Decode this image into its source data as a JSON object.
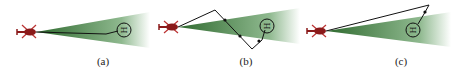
{
  "figure": {
    "panels": [
      {
        "id": "a",
        "caption": "(a)",
        "description": "Helicopter with sensor cone; path stays inside cone to helipad"
      },
      {
        "id": "b",
        "caption": "(b)",
        "description": "Zig-zag path crossing cone boundaries, marked with dots"
      },
      {
        "id": "c",
        "caption": "(c)",
        "description": "Path goes above cone and enters near helipad"
      }
    ],
    "helipad_label": "H",
    "colors": {
      "helicopter": "#8b1a1a",
      "cone_dark": "#3f7a3f",
      "cone_light": "#ffffff",
      "path": "#111111",
      "marker": "#111111"
    }
  }
}
